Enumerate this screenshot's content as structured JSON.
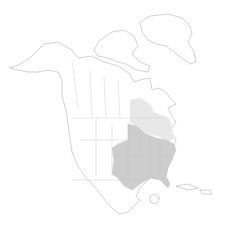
{
  "map": {
    "region": "North America",
    "type": "range-map",
    "colors": {
      "background": "#ffffff",
      "land": "#ffffff",
      "outline": "#b4b4b4",
      "range_primary": "#cdcdcd",
      "range_secondary": "#e8e8e8"
    },
    "layers": [
      {
        "name": "primary-range",
        "description": "Eastern and central United States"
      },
      {
        "name": "secondary-range",
        "description": "Great Lakes / Ontario / northeastern region"
      }
    ]
  }
}
